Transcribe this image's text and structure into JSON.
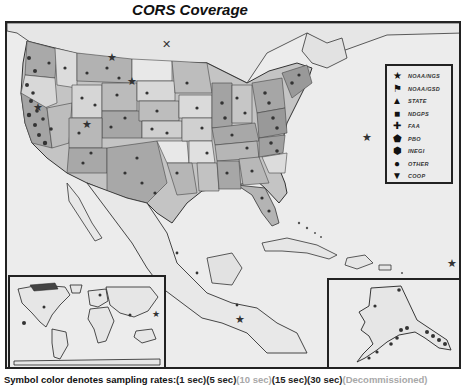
{
  "title": "CORS Coverage",
  "legend": {
    "items": [
      {
        "symbol": "★",
        "label": "NOAA/NGS"
      },
      {
        "symbol": "⚑",
        "label": "NOAA/GSD"
      },
      {
        "symbol": "▲",
        "label": "STATE"
      },
      {
        "symbol": "■",
        "label": "NDGPS"
      },
      {
        "symbol": "✚",
        "label": "FAA"
      },
      {
        "symbol": "⬟",
        "label": "PBO"
      },
      {
        "symbol": "⬢",
        "label": "INEGI"
      },
      {
        "symbol": "●",
        "label": "OTHER"
      },
      {
        "symbol": "▼",
        "label": "COOP"
      }
    ]
  },
  "insets": {
    "world": "World inset map",
    "alaska": "Alaska inset map"
  },
  "footer": {
    "lead": "Symbol color denotes sampling rates:",
    "rates": [
      {
        "label": "(1 sec)",
        "tone": "dark"
      },
      {
        "label": "(5 sec)",
        "tone": "dark"
      },
      {
        "label": "(10 sec)",
        "tone": "light"
      },
      {
        "label": "(15 sec)",
        "tone": "dark"
      },
      {
        "label": "(30 sec)",
        "tone": "dark"
      },
      {
        "label": "(Decommissioned)",
        "tone": "light"
      }
    ]
  },
  "colors": {
    "land_dark": "#a9a9a9",
    "land_mid": "#c4c4c4",
    "land_light": "#e4e4e4",
    "water": "#ececec",
    "border": "#222222",
    "station": "#333333"
  }
}
